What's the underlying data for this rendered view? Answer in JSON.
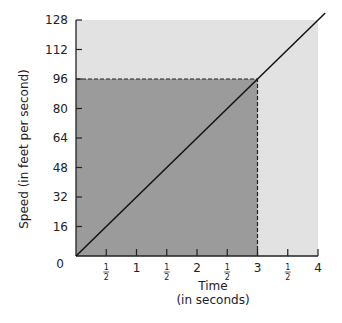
{
  "chart_data": {
    "type": "line",
    "title": "",
    "xlabel": "Time",
    "xlabel_sub": "(in seconds)",
    "ylabel": "Speed (in feet per second)",
    "xlim": [
      0,
      4
    ],
    "ylim": [
      0,
      128
    ],
    "x_ticks": [
      {
        "value": 0.5,
        "label": "1/2"
      },
      {
        "value": 1,
        "label": "1"
      },
      {
        "value": 1.5,
        "label": "1/2"
      },
      {
        "value": 2,
        "label": "2"
      },
      {
        "value": 2.5,
        "label": "1/2"
      },
      {
        "value": 3,
        "label": "3"
      },
      {
        "value": 3.5,
        "label": "1/2"
      },
      {
        "value": 4,
        "label": "4"
      }
    ],
    "y_ticks": [
      0,
      16,
      32,
      48,
      64,
      80,
      96,
      112,
      128
    ],
    "origin_label": "0",
    "series": [
      {
        "name": "speed",
        "x": [
          0,
          4
        ],
        "y": [
          0,
          128
        ]
      }
    ],
    "shaded_region": {
      "x": [
        0,
        3
      ],
      "y": [
        0,
        96
      ],
      "color": "#9b9b9b"
    },
    "background_region": {
      "x": [
        0,
        4
      ],
      "y": [
        0,
        128
      ],
      "color": "#e2e2e2"
    },
    "dashed_guides": [
      {
        "from": [
          0,
          96
        ],
        "to": [
          3,
          96
        ]
      },
      {
        "from": [
          3,
          0
        ],
        "to": [
          3,
          96
        ]
      }
    ],
    "grid": false
  }
}
